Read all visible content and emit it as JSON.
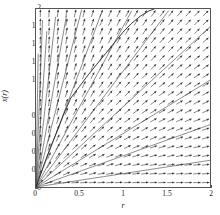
{
  "figure": {
    "title": "",
    "xlabel": "r",
    "ylabel": "x(r)"
  },
  "axes": {
    "x_ticks": [
      "0",
      "0.5",
      "1",
      "1.5",
      "2"
    ],
    "x_tick_values": [
      0,
      0.5,
      1,
      1.5,
      2
    ],
    "y_ticks": [
      "0",
      "0.2",
      "0.4",
      "0.6",
      "0.8",
      "1",
      "1.2",
      "1.4",
      "1.6",
      "1.8",
      "2"
    ],
    "y_tick_values": [
      0,
      0.2,
      0.4,
      0.6,
      0.8,
      1,
      1.2,
      1.4,
      1.6,
      1.8,
      2
    ],
    "xlim": [
      0,
      2
    ],
    "ylim": [
      0,
      2
    ],
    "grid": false,
    "box": true,
    "axis_color": "#555555"
  },
  "chart_data": {
    "type": "quiver",
    "title": "",
    "xlabel": "r",
    "ylabel": "x(r)",
    "xlim": [
      0,
      2
    ],
    "ylim": [
      0,
      2
    ],
    "grid": false,
    "legend": "none",
    "slope_formula": "x/r",
    "vector_grid": {
      "nx": 20,
      "ny": 20,
      "x_start": 0.05,
      "x_step": 0.1,
      "y_start": 0.05,
      "y_step": 0.1,
      "arrow_color": "#333333",
      "arrow_length_px": 7.5
    },
    "solution_curves": [
      {
        "name": "x = 0.15 r",
        "slope": 0.15,
        "color": "#555555"
      },
      {
        "name": "x = 0.35 r",
        "slope": 0.35,
        "color": "#555555"
      },
      {
        "name": "x = 0.6 r",
        "slope": 0.6,
        "color": "#555555"
      },
      {
        "name": "x = 0.9 r",
        "slope": 0.9,
        "color": "#555555"
      },
      {
        "name": "x = 1.3 r",
        "slope": 1.3,
        "color": "#555555"
      },
      {
        "name": "x = 1.8 r",
        "slope": 1.8,
        "color": "#555555"
      },
      {
        "name": "x = 2.6 r",
        "slope": 2.6,
        "color": "#555555"
      },
      {
        "name": "x = 3.8 r",
        "slope": 3.8,
        "color": "#555555"
      },
      {
        "name": "x = 5.5 r",
        "slope": 5.5,
        "color": "#555555"
      },
      {
        "name": "x = 8.5 r",
        "slope": 8.5,
        "color": "#555555"
      },
      {
        "name": "x = 14 r",
        "slope": 14,
        "color": "#555555"
      },
      {
        "name": "x = 25 r",
        "slope": 25,
        "color": "#555555"
      },
      {
        "name": "x = 60 r",
        "slope": 60,
        "color": "#555555"
      }
    ],
    "highlighted_trajectory": {
      "name": "sample solution",
      "color": "#222222",
      "points": [
        [
          0.0,
          0.0
        ],
        [
          0.08,
          0.22
        ],
        [
          0.16,
          0.43
        ],
        [
          0.24,
          0.62
        ],
        [
          0.32,
          0.82
        ],
        [
          0.4,
          1.0
        ],
        [
          0.5,
          1.13
        ],
        [
          0.6,
          1.26
        ],
        [
          0.7,
          1.38
        ],
        [
          0.8,
          1.5
        ],
        [
          0.9,
          1.62
        ],
        [
          1.0,
          1.74
        ],
        [
          1.1,
          1.84
        ],
        [
          1.2,
          1.92
        ],
        [
          1.3,
          1.98
        ],
        [
          1.36,
          2.0
        ]
      ]
    }
  }
}
